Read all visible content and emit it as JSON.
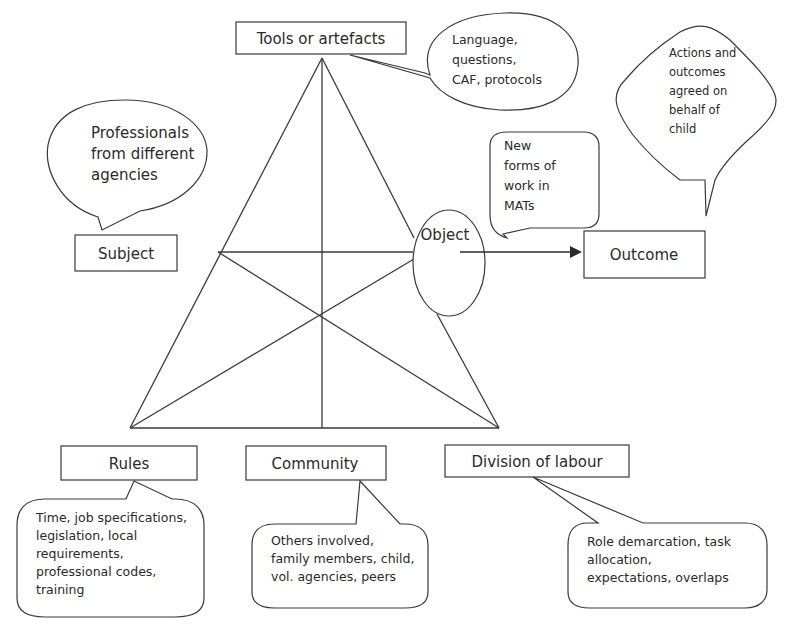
{
  "diagram": {
    "type": "activity-theory-triangle",
    "nodes": {
      "tools": {
        "label": "Tools or artefacts"
      },
      "subject": {
        "label": "Subject"
      },
      "object": {
        "label": "Object"
      },
      "outcome": {
        "label": "Outcome"
      },
      "rules": {
        "label": "Rules"
      },
      "community": {
        "label": "Community"
      },
      "division": {
        "label": "Division of labour"
      }
    },
    "callouts": {
      "tools": {
        "lines": [
          "Language,",
          "questions,",
          "CAF, protocols"
        ]
      },
      "subject": {
        "lines": [
          "Professionals",
          "from different",
          "agencies"
        ]
      },
      "object": {
        "lines": [
          "New",
          "forms of",
          "work in",
          "MATs"
        ]
      },
      "outcome": {
        "lines": [
          "Actions and",
          "outcomes",
          "agreed on",
          "behalf of",
          "child"
        ]
      },
      "rules": {
        "lines": [
          "Time, job specifications,",
          "legislation, local",
          "requirements,",
          "professional codes,",
          "training"
        ]
      },
      "community": {
        "lines": [
          "Others involved,",
          "family members, child,",
          "vol. agencies, peers"
        ]
      },
      "division": {
        "lines": [
          "Role demarcation, task",
          "allocation,",
          "expectations, overlaps"
        ]
      }
    },
    "edges": [
      {
        "from": "object",
        "to": "outcome",
        "type": "arrow"
      }
    ],
    "colors": {
      "line": "#3a3a3a",
      "text": "#2a2a2a",
      "background": "#ffffff"
    }
  }
}
